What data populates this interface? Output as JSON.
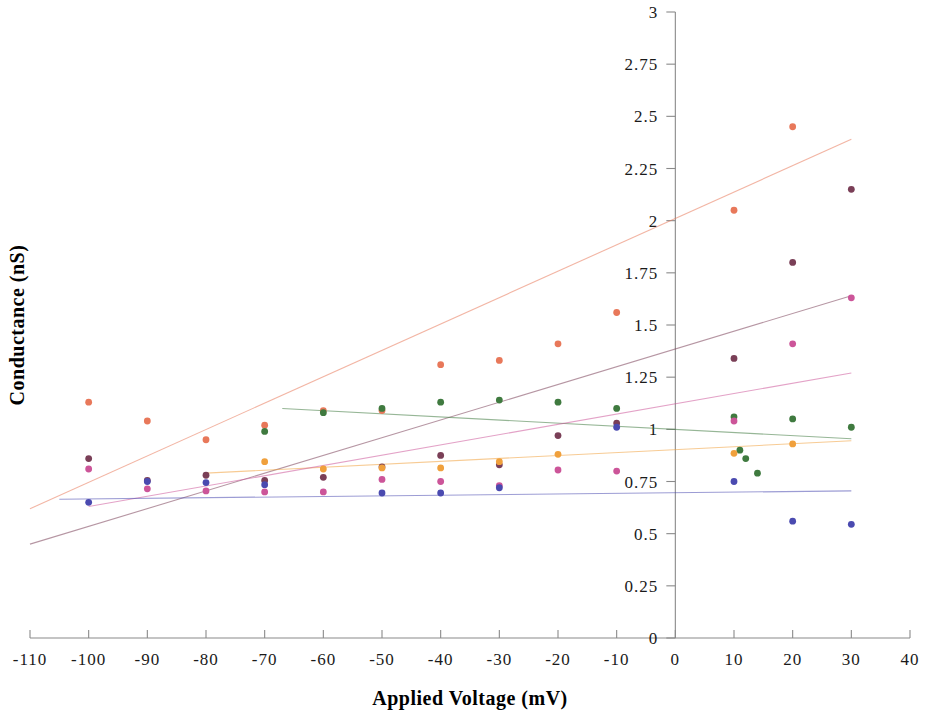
{
  "chart_data": {
    "type": "scatter",
    "title": "",
    "xlabel": "Applied Voltage (mV)",
    "ylabel": "Conductance (nS)",
    "xlim": [
      -110,
      40
    ],
    "ylim": [
      0,
      3
    ],
    "xticks": [
      -110,
      -100,
      -90,
      -80,
      -70,
      -60,
      -50,
      -40,
      -30,
      -20,
      -10,
      0,
      10,
      20,
      30,
      40
    ],
    "xtick_labels": [
      "-110",
      "-100",
      "-90",
      "-80",
      "-70",
      "-60",
      "-50",
      "-40",
      "-30",
      "-20",
      "-10",
      "0",
      "10",
      "20",
      "30",
      "40"
    ],
    "yticks": [
      0,
      0.25,
      0.5,
      0.75,
      1,
      1.25,
      1.5,
      1.75,
      2,
      2.25,
      2.5,
      2.75,
      3
    ],
    "ytick_labels": [
      "0",
      "0.25",
      "0.5",
      "0.75",
      "1",
      "1.25",
      "1.5",
      "1.75",
      "2",
      "2.25",
      "2.5",
      "2.75",
      "3"
    ],
    "grid": false,
    "legend": "none",
    "y_axis_position_x": 0,
    "series": [
      {
        "name": "series-1-salmon",
        "color": "#e8785a",
        "points": [
          {
            "x": -100,
            "y": 1.13
          },
          {
            "x": -90,
            "y": 1.04
          },
          {
            "x": -80,
            "y": 0.95
          },
          {
            "x": -70,
            "y": 1.02
          },
          {
            "x": -60,
            "y": 1.09
          },
          {
            "x": -50,
            "y": 1.09
          },
          {
            "x": -40,
            "y": 1.31
          },
          {
            "x": -30,
            "y": 1.33
          },
          {
            "x": -20,
            "y": 1.41
          },
          {
            "x": -10,
            "y": 1.56
          },
          {
            "x": 10,
            "y": 2.05
          },
          {
            "x": 20,
            "y": 2.45
          }
        ],
        "trend": {
          "x0": -110,
          "y0": 0.62,
          "x1": 30,
          "y1": 2.39
        }
      },
      {
        "name": "series-2-maroon",
        "color": "#7a3f57",
        "points": [
          {
            "x": -100,
            "y": 0.86
          },
          {
            "x": -90,
            "y": 0.755
          },
          {
            "x": -80,
            "y": 0.78
          },
          {
            "x": -70,
            "y": 0.755
          },
          {
            "x": -60,
            "y": 0.77
          },
          {
            "x": -50,
            "y": 0.82
          },
          {
            "x": -40,
            "y": 0.875
          },
          {
            "x": -30,
            "y": 0.83
          },
          {
            "x": -20,
            "y": 0.97
          },
          {
            "x": -10,
            "y": 1.03
          },
          {
            "x": 10,
            "y": 1.34
          },
          {
            "x": 20,
            "y": 1.8
          },
          {
            "x": 30,
            "y": 2.15
          }
        ],
        "trend": {
          "x0": -110,
          "y0": 0.45,
          "x1": 30,
          "y1": 1.64
        }
      },
      {
        "name": "series-3-green",
        "color": "#3f7a3f",
        "points": [
          {
            "x": -70,
            "y": 0.99
          },
          {
            "x": -60,
            "y": 1.08
          },
          {
            "x": -50,
            "y": 1.1
          },
          {
            "x": -40,
            "y": 1.13
          },
          {
            "x": -30,
            "y": 1.14
          },
          {
            "x": -20,
            "y": 1.13
          },
          {
            "x": -10,
            "y": 1.1
          },
          {
            "x": 10,
            "y": 1.06
          },
          {
            "x": 11,
            "y": 0.9
          },
          {
            "x": 12,
            "y": 0.86
          },
          {
            "x": 14,
            "y": 0.79
          },
          {
            "x": 20,
            "y": 1.05
          },
          {
            "x": 30,
            "y": 1.01
          }
        ],
        "trend": {
          "x0": -67,
          "y0": 1.1,
          "x1": 30,
          "y1": 0.955
        }
      },
      {
        "name": "series-4-orange",
        "color": "#f0a03c",
        "points": [
          {
            "x": -70,
            "y": 0.845
          },
          {
            "x": -60,
            "y": 0.81
          },
          {
            "x": -50,
            "y": 0.815
          },
          {
            "x": -40,
            "y": 0.815
          },
          {
            "x": -30,
            "y": 0.845
          },
          {
            "x": -20,
            "y": 0.88
          },
          {
            "x": 10,
            "y": 0.885
          },
          {
            "x": 20,
            "y": 0.93
          }
        ],
        "trend": {
          "x0": -80,
          "y0": 0.79,
          "x1": 30,
          "y1": 0.945
        }
      },
      {
        "name": "series-5-pink",
        "color": "#cc5599",
        "points": [
          {
            "x": -100,
            "y": 0.81
          },
          {
            "x": -90,
            "y": 0.715
          },
          {
            "x": -80,
            "y": 0.705
          },
          {
            "x": -70,
            "y": 0.7
          },
          {
            "x": -60,
            "y": 0.7
          },
          {
            "x": -50,
            "y": 0.76
          },
          {
            "x": -40,
            "y": 0.75
          },
          {
            "x": -30,
            "y": 0.73
          },
          {
            "x": -20,
            "y": 0.805
          },
          {
            "x": -10,
            "y": 0.8
          },
          {
            "x": 10,
            "y": 1.04
          },
          {
            "x": 20,
            "y": 1.41
          },
          {
            "x": 30,
            "y": 1.63
          }
        ],
        "trend": {
          "x0": -100,
          "y0": 0.63,
          "x1": 30,
          "y1": 1.27
        }
      },
      {
        "name": "series-6-blue",
        "color": "#4a4ab0",
        "points": [
          {
            "x": -100,
            "y": 0.65
          },
          {
            "x": -90,
            "y": 0.75
          },
          {
            "x": -80,
            "y": 0.745
          },
          {
            "x": -70,
            "y": 0.735
          },
          {
            "x": -50,
            "y": 0.695
          },
          {
            "x": -40,
            "y": 0.695
          },
          {
            "x": -30,
            "y": 0.72
          },
          {
            "x": -10,
            "y": 1.01
          },
          {
            "x": 10,
            "y": 0.75
          },
          {
            "x": 20,
            "y": 0.56
          },
          {
            "x": 30,
            "y": 0.545
          }
        ],
        "trend": {
          "x0": -105,
          "y0": 0.665,
          "x1": 30,
          "y1": 0.705
        }
      }
    ]
  }
}
